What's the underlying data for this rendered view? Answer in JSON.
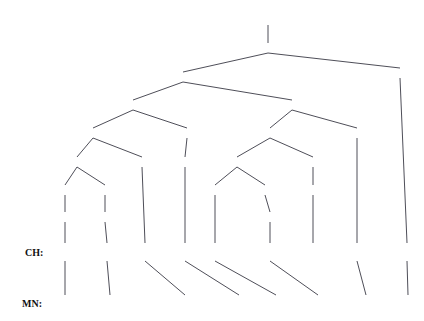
{
  "figure": {
    "type": "syntax-parse-tree-alignment",
    "root_label": "Root",
    "line_color": "#3a3a45",
    "text_color": "#1a1a1a"
  },
  "rows": {
    "ch_tag": "CH:",
    "mn_tag": "MN:"
  },
  "nodes": [
    {
      "id": "root",
      "label": "Root",
      "x": 268,
      "y": 20
    },
    {
      "id": "ip0",
      "label": "IP",
      "x": 268,
      "y": 48
    },
    {
      "id": "vp0",
      "label": "VP",
      "x": 183,
      "y": 77
    },
    {
      "id": "pu0",
      "label": "PU",
      "x": 400,
      "y": 73
    },
    {
      "id": "vp1",
      "label": "VP",
      "x": 133,
      "y": 105
    },
    {
      "id": "vp2",
      "label": "VP",
      "x": 292,
      "y": 105
    },
    {
      "id": "vp3",
      "label": "VP",
      "x": 93,
      "y": 133
    },
    {
      "id": "vp4",
      "label": "VP",
      "x": 187,
      "y": 133
    },
    {
      "id": "np1",
      "label": "NP",
      "x": 270,
      "y": 133
    },
    {
      "id": "vv3",
      "label": "VV",
      "x": 357,
      "y": 133
    },
    {
      "id": "np0",
      "label": "NP",
      "x": 77,
      "y": 162
    },
    {
      "id": "vv0",
      "label": "VV",
      "x": 142,
      "y": 162
    },
    {
      "id": "vv1",
      "label": "VV",
      "x": 185,
      "y": 162
    },
    {
      "id": "qp0",
      "label": "QP",
      "x": 237,
      "y": 162
    },
    {
      "id": "np2",
      "label": "NP",
      "x": 313,
      "y": 162
    },
    {
      "id": "ip1",
      "label": "IP",
      "x": 65,
      "y": 190
    },
    {
      "id": "np3",
      "label": "NP",
      "x": 105,
      "y": 190
    },
    {
      "id": "cd0",
      "label": "CD",
      "x": 215,
      "y": 190
    },
    {
      "id": "clp0",
      "label": "CLP",
      "x": 265,
      "y": 190
    },
    {
      "id": "nn1",
      "label": "NN",
      "x": 313,
      "y": 190
    },
    {
      "id": "vp5",
      "label": "VP",
      "x": 65,
      "y": 217
    },
    {
      "id": "nn0",
      "label": "NN",
      "x": 105,
      "y": 217
    },
    {
      "id": "m0",
      "label": "M",
      "x": 270,
      "y": 217
    }
  ],
  "edges": [
    {
      "from": "root",
      "to": "ip0"
    },
    {
      "from": "ip0",
      "to": "vp0"
    },
    {
      "from": "ip0",
      "to": "pu0"
    },
    {
      "from": "vp0",
      "to": "vp1"
    },
    {
      "from": "vp0",
      "to": "vp2"
    },
    {
      "from": "vp1",
      "to": "vp3"
    },
    {
      "from": "vp1",
      "to": "vp4"
    },
    {
      "from": "vp2",
      "to": "np1"
    },
    {
      "from": "vp2",
      "to": "vv3"
    },
    {
      "from": "vp3",
      "to": "np0"
    },
    {
      "from": "vp3",
      "to": "vv0"
    },
    {
      "from": "vp4",
      "to": "vv1"
    },
    {
      "from": "np1",
      "to": "qp0"
    },
    {
      "from": "np1",
      "to": "np2"
    },
    {
      "from": "np0",
      "to": "ip1"
    },
    {
      "from": "np0",
      "to": "np3"
    },
    {
      "from": "qp0",
      "to": "cd0"
    },
    {
      "from": "qp0",
      "to": "clp0"
    },
    {
      "from": "np2",
      "to": "nn1"
    },
    {
      "from": "ip1",
      "to": "vp5"
    },
    {
      "from": "np3",
      "to": "nn0"
    },
    {
      "from": "clp0",
      "to": "m0"
    }
  ],
  "ch_tokens": [
    {
      "id": "ch0",
      "text": "这些",
      "x": 65,
      "y": 252,
      "parent": "vp5"
    },
    {
      "id": "ch1",
      "text": "难题",
      "x": 107,
      "y": 252,
      "parent": "nn0"
    },
    {
      "id": "ch2",
      "text": "解决",
      "x": 145,
      "y": 252,
      "parent": "vv0"
    },
    {
      "id": "ch3",
      "text": "得",
      "x": 185,
      "y": 252,
      "parent": "vv1"
    },
    {
      "id": "ch4",
      "text": "几",
      "x": 215,
      "y": 252,
      "parent": "cd0"
    },
    {
      "id": "ch5",
      "text": "周",
      "x": 270,
      "y": 252,
      "parent": "m0"
    },
    {
      "id": "ch6",
      "text": "时间",
      "x": 313,
      "y": 252,
      "parent": "nn1"
    },
    {
      "id": "ch7",
      "text": "要",
      "x": 357,
      "y": 252,
      "parent": "vv3"
    },
    {
      "id": "ch8",
      "text": "。",
      "x": 407,
      "y": 252,
      "parent": "pu0"
    }
  ],
  "mn_tokens": [
    {
      "id": "mn0",
      "text": "ENE",
      "x": 65,
      "y": 303
    },
    {
      "id": "mn1",
      "text": "BERHSIYEL-I",
      "x": 110,
      "y": 303
    },
    {
      "id": "mn2",
      "text": "SIYIDHU-DU",
      "x": 185,
      "y": 303
    },
    {
      "id": "mn3",
      "text": "BIDE",
      "x": 239,
      "y": 303
    },
    {
      "id": "mn4",
      "text": "HEDUN",
      "x": 276,
      "y": 303
    },
    {
      "id": "mn5",
      "text": "D0L0G_A",
      "x": 318,
      "y": 303
    },
    {
      "id": "mn6",
      "text": "HEREGLEN_E",
      "x": 366,
      "y": 303
    },
    {
      "id": "mn7",
      "text": ".",
      "x": 408,
      "y": 303
    }
  ],
  "alignment_links": [
    {
      "from_x": 65,
      "to_x": 65
    },
    {
      "from_x": 107,
      "to_x": 110
    },
    {
      "from_x": 145,
      "to_x": 185
    },
    {
      "from_x": 185,
      "to_x": 239
    },
    {
      "from_x": 215,
      "to_x": 276
    },
    {
      "from_x": 270,
      "to_x": 318
    },
    {
      "from_x": 357,
      "to_x": 366
    },
    {
      "from_x": 407,
      "to_x": 408
    }
  ]
}
